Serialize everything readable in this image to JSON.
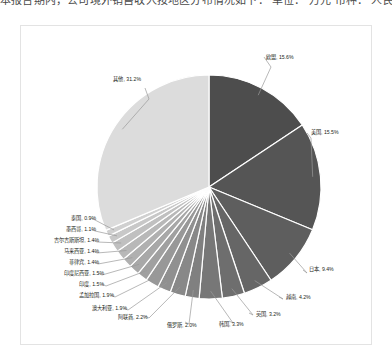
{
  "top_clipped_line": {
    "note": "partially cropped text line at very top of screenshot",
    "segments": [
      "本报告期内",
      "公司境外销售收入按地区分布情况如下",
      "单位",
      "万元",
      "币种",
      "人民币"
    ],
    "joined": "本报告期内，公司境外销售收入按地区分布情况如下：        单位：  万元  币种：  人民币"
  },
  "chart_data": {
    "type": "pie",
    "title": "",
    "subtitle": "",
    "xlabel": "",
    "ylabel": "",
    "grid": false,
    "legend": "none",
    "label_format": "{name}, {value}%",
    "start_angle_deg": 0,
    "direction": "clockwise",
    "categories": [
      "欧盟",
      "美国",
      "日本",
      "越南",
      "英国",
      "韩国",
      "俄罗斯",
      "阿联酋",
      "澳大利亚",
      "孟加拉国",
      "印度",
      "印度尼西亚",
      "菲律宾",
      "马来西亚",
      "吉尔吉斯斯坦",
      "墨西哥",
      "泰国",
      "其他"
    ],
    "values": [
      15.6,
      15.5,
      9.4,
      4.2,
      3.2,
      3.3,
      2.0,
      2.2,
      1.9,
      1.9,
      1.5,
      1.5,
      1.4,
      1.4,
      1.4,
      1.1,
      0.9,
      31.2
    ],
    "slices": [
      {
        "name": "欧盟",
        "value": 15.6,
        "label": "欧盟, 15.6%",
        "color": "#4d4d4d"
      },
      {
        "name": "美国",
        "value": 15.5,
        "label": "美国, 15.5%",
        "color": "#555555"
      },
      {
        "name": "日本",
        "value": 9.4,
        "label": "日本, 9.4%",
        "color": "#5e5e5e"
      },
      {
        "name": "越南",
        "value": 4.2,
        "label": "越南, 4.2%",
        "color": "#666666"
      },
      {
        "name": "英国",
        "value": 3.2,
        "label": "英国, 3.2%",
        "color": "#6e6e6e"
      },
      {
        "name": "韩国",
        "value": 3.3,
        "label": "韩国, 3.3%",
        "color": "#777777"
      },
      {
        "name": "俄罗斯",
        "value": 2.0,
        "label": "俄罗斯, 2.0%",
        "color": "#808080"
      },
      {
        "name": "阿联酋",
        "value": 2.2,
        "label": "阿联酋, 2.2%",
        "color": "#888888"
      },
      {
        "name": "澳大利亚",
        "value": 1.9,
        "label": "澳大利亚, 1.9%",
        "color": "#909090"
      },
      {
        "name": "孟加拉国",
        "value": 1.9,
        "label": "孟加拉国, 1.9%",
        "color": "#989898"
      },
      {
        "name": "印度",
        "value": 1.5,
        "label": "印度, 1.5%",
        "color": "#a0a0a0"
      },
      {
        "name": "印度尼西亚",
        "value": 1.5,
        "label": "印度尼西亚, 1.5%",
        "color": "#a8a8a8"
      },
      {
        "name": "菲律宾",
        "value": 1.4,
        "label": "菲律宾, 1.4%",
        "color": "#b0b0b0"
      },
      {
        "name": "马来西亚",
        "value": 1.4,
        "label": "马来西亚, 1.4%",
        "color": "#b8b8b8"
      },
      {
        "name": "吉尔吉斯斯坦",
        "value": 1.4,
        "label": "吉尔吉斯斯坦, 1.4%",
        "color": "#c0c0c0"
      },
      {
        "name": "墨西哥",
        "value": 1.1,
        "label": "墨西哥, 1.1%",
        "color": "#c8c8c8"
      },
      {
        "name": "泰国",
        "value": 0.9,
        "label": "泰国, 0.9%",
        "color": "#d0d0d0"
      },
      {
        "name": "其他",
        "value": 31.2,
        "label": "其他, 31.2%",
        "color": "#dcdcdc"
      }
    ],
    "style": {
      "slice_border_color": "#ffffff",
      "slice_border_width": 1.2,
      "leader_line_color": "#9a9a9a",
      "plot_background": "#ffffff",
      "frame_border_color": "#e3e3e3",
      "label_text_color": "#231f20"
    },
    "geometry": {
      "cx": 188,
      "cy": 161,
      "r": 112
    }
  },
  "labels": {
    "eu": {
      "text": "欧盟, 15.6%"
    },
    "us": {
      "text": "美国, 15.5%"
    },
    "japan": {
      "text": "日本, 9.4%"
    },
    "vietnam": {
      "text": "越南, 4.2%"
    },
    "uk": {
      "text": "英国, 3.2%"
    },
    "korea": {
      "text": "韩国, 3.3%"
    },
    "russia": {
      "text": "俄罗斯, 2.0%"
    },
    "uae": {
      "text": "阿联酋, 2.2%"
    },
    "australia": {
      "text": "澳大利亚, 1.9%"
    },
    "bangladesh": {
      "text": "孟加拉国, 1.9%"
    },
    "india": {
      "text": "印度, 1.5%"
    },
    "indonesia": {
      "text": "印度尼西亚, 1.5%"
    },
    "philippines": {
      "text": "菲律宾, 1.4%"
    },
    "malaysia": {
      "text": "马来西亚, 1.4%"
    },
    "kyrgyzstan": {
      "text": "吉尔吉斯斯坦, 1.4%"
    },
    "mexico": {
      "text": "墨西哥, 1.1%"
    },
    "thailand": {
      "text": "泰国, 0.9%"
    },
    "other": {
      "text": "其他, 31.2%"
    }
  }
}
